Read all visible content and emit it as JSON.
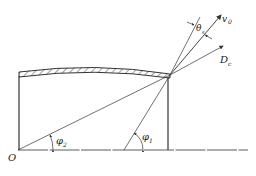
{
  "diagram": {
    "labels": {
      "origin": "O",
      "phi1": "φ",
      "phi1_sub": "1",
      "phi2": "φ",
      "phi2_sub": "2",
      "theta": "θ",
      "theta_sub": "s",
      "v0": "v",
      "v0_sub": "0",
      "dc": "D",
      "dc_sub": "c"
    },
    "colors": {
      "line": "#333333",
      "hatch": "#444444"
    }
  }
}
